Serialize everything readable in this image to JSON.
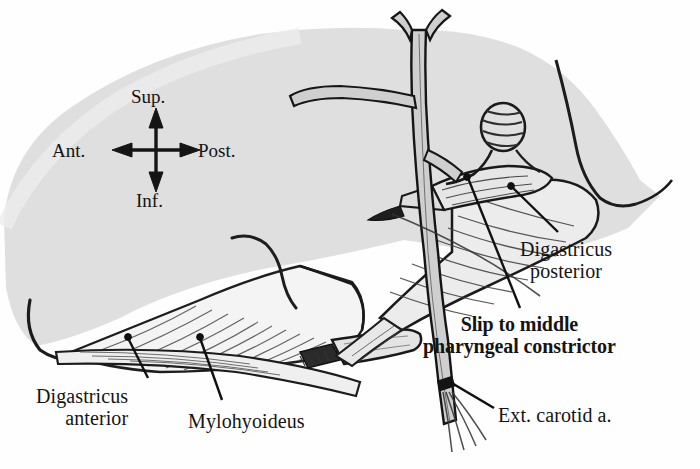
{
  "figure": {
    "kind": "anatomical-illustration",
    "background_color": "#fefefe",
    "ink_color": "#141414",
    "tissue_fill": "#d9d9d9",
    "muscle_fill": "#f2f2f2",
    "vessel_fill": "#cfcfcf"
  },
  "compass": {
    "name": "orientation-compass",
    "superior": "Sup.",
    "inferior": "Inf.",
    "anterior": "Ant.",
    "posterior": "Post."
  },
  "labels": {
    "digastricus_anterior": "Digastricus\nanterior",
    "mylohyoideus": "Mylohyoideus",
    "digastricus_posterior": "Digastricus\nposterior",
    "slip_to_constrictor": "Slip to middle\npharyngeal constrictor",
    "ext_carotid": "Ext. carotid a."
  }
}
